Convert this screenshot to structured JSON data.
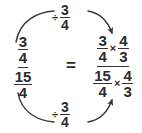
{
  "diagram": {
    "kind": "complex-fraction-transformation",
    "background_color": "#ffffff",
    "ink_color": "#2b2b2b",
    "rule_color": "#333333",
    "equals": "=",
    "multiply_symbol": "×",
    "divide_symbol": "÷"
  },
  "left_expression": {
    "label": "complex fraction",
    "numerator": {
      "num": "3",
      "den": "4"
    },
    "denominator": {
      "num": "15",
      "den": "4"
    }
  },
  "right_expression": {
    "label": "complex fraction multiplied by reciprocal",
    "numerator": {
      "first": {
        "num": "3",
        "den": "4"
      },
      "operator": "×",
      "second": {
        "num": "4",
        "den": "3"
      }
    },
    "denominator": {
      "first": {
        "num": "15",
        "den": "4"
      },
      "operator": "×",
      "second": {
        "num": "4",
        "den": "3"
      }
    }
  },
  "top_arrow": {
    "operator": "÷",
    "operand": {
      "num": "3",
      "den": "4"
    },
    "direction": "left-to-right"
  },
  "bottom_arrow": {
    "operator": "÷",
    "operand": {
      "num": "3",
      "den": "4"
    },
    "direction": "left-to-right"
  }
}
